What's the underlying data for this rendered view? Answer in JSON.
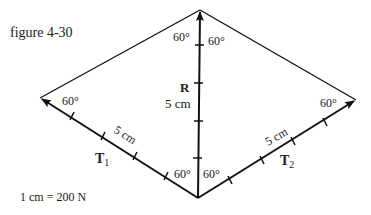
{
  "figure": {
    "caption": "figure 4-30",
    "scale_note": "1 cm = 200 N"
  },
  "vectors": {
    "R": {
      "label": "R",
      "length": "5 cm",
      "angle_left": "60°",
      "angle_right": "60°"
    },
    "T1": {
      "label": "T",
      "subscript": "1",
      "length": "5 cm",
      "angle_tip": "60°",
      "angle_base": "60°"
    },
    "T2": {
      "label": "T",
      "subscript": "2",
      "length": "5 cm",
      "angle_tip": "60°",
      "angle_base": "60°"
    }
  },
  "colors": {
    "line": "#111111",
    "background": "#ffffff"
  }
}
